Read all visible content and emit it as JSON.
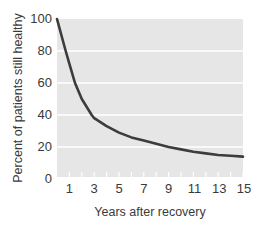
{
  "chart_data": {
    "type": "line",
    "title": "",
    "xlabel": "Years after recovery",
    "ylabel": "Percent of patients still healthy",
    "x_ticks": [
      1,
      3,
      5,
      7,
      9,
      11,
      13,
      15
    ],
    "y_ticks": [
      0,
      20,
      40,
      60,
      80,
      100
    ],
    "xlim": [
      0,
      15
    ],
    "ylim": [
      0,
      100
    ],
    "grid": "horizontal",
    "legend": null,
    "series": [
      {
        "name": "Percent still healthy",
        "x": [
          0,
          0.7,
          1,
          1.45,
          2,
          2.8,
          3,
          4,
          5,
          6,
          7,
          8,
          9,
          10,
          11,
          12,
          13,
          14,
          15
        ],
        "y": [
          100,
          80,
          72,
          60,
          50,
          40,
          38,
          33,
          29,
          26,
          24,
          22,
          20,
          18.5,
          17,
          16,
          15,
          14.5,
          14
        ]
      }
    ]
  },
  "colors": {
    "plot_bg": "#e6e6e6",
    "grid": "#ffffff",
    "line": "#3c3c3c",
    "text": "#3a3a3a"
  }
}
